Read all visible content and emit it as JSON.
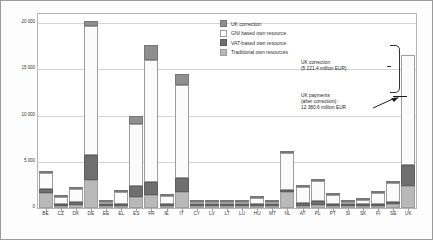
{
  "chart_data": {
    "type": "bar",
    "title": "",
    "xlabel": "",
    "ylabel": "",
    "ylim": [
      0,
      21000
    ],
    "yticks": [
      "0",
      "5 000",
      "10 000",
      "15 000",
      "20 000"
    ],
    "ytick_values": [
      0,
      5000,
      10000,
      15000,
      20000
    ],
    "grid": true,
    "stacked": true,
    "legend_position": "top-right",
    "categories": [
      "BE",
      "CZ",
      "DK",
      "DE",
      "EE",
      "EL",
      "ES",
      "FR",
      "IE",
      "IT",
      "CY",
      "LV",
      "LT",
      "LU",
      "HU",
      "MT",
      "NL",
      "AT",
      "PL",
      "PT",
      "SI",
      "SK",
      "FI",
      "SE",
      "UK"
    ],
    "series": [
      {
        "name": "Traditional own resources",
        "values": [
          1600,
          190,
          330,
          3000,
          20,
          190,
          1200,
          1450,
          190,
          1750,
          30,
          20,
          30,
          15,
          90,
          10,
          1700,
          170,
          340,
          120,
          70,
          90,
          120,
          450,
          2400
        ]
      },
      {
        "name": "VAT-based own resource",
        "values": [
          450,
          180,
          280,
          2700,
          20,
          270,
          1150,
          1400,
          200,
          1450,
          30,
          25,
          40,
          35,
          130,
          10,
          240,
          310,
          460,
          200,
          60,
          90,
          250,
          190,
          2250
        ]
      },
      {
        "name": "GNI based own resource",
        "values": [
          1750,
          790,
          1480,
          14000,
          80,
          1220,
          6800,
          13200,
          900,
          10100,
          110,
          140,
          190,
          200,
          630,
          40,
          4050,
          1700,
          2100,
          980,
          250,
          400,
          1180,
          2000,
          11900
        ]
      },
      {
        "name": "UK correction",
        "values": [
          220,
          95,
          175,
          520,
          10,
          145,
          800,
          1550,
          105,
          1180,
          15,
          15,
          20,
          25,
          75,
          5,
          85,
          60,
          250,
          115,
          30,
          45,
          140,
          75,
          -5221
        ]
      }
    ],
    "annotations": [
      {
        "id": "uk-correction",
        "text": "UK correction\n(5 221.4 million EUR)",
        "value": 5221.4
      },
      {
        "id": "uk-payments",
        "text": "UK payments\n(after correction):\n12 380.6 million EUR",
        "value": 12380.6
      }
    ]
  },
  "legend": {
    "items": [
      {
        "label": "UK correction",
        "color": "#8f8f8f",
        "key": "corr"
      },
      {
        "label": "GNI based own resource",
        "color": "#fdfdfd",
        "key": "gni"
      },
      {
        "label": "VAT-based own resource",
        "color": "#6f6f6f",
        "key": "vat"
      },
      {
        "label": "Traditional own resources",
        "color": "#b9b9b9",
        "key": "trad"
      }
    ]
  }
}
